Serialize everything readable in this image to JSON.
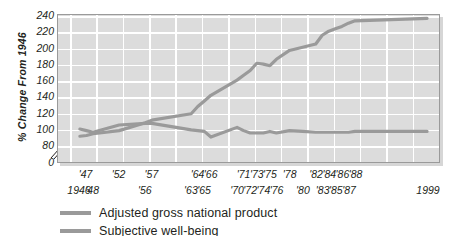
{
  "chart_data": {
    "type": "line",
    "title": "",
    "xlabel": "",
    "ylabel": "% Change From 1946",
    "ylim": [
      80,
      240
    ],
    "y_ticks": [
      "0",
      "80",
      "100",
      "120",
      "140",
      "160",
      "180",
      "200",
      "220",
      "240"
    ],
    "y_axis_break": true,
    "grid": true,
    "legend_position": "below",
    "x_tick_labels_top": [
      "'47",
      "'52",
      "'57",
      "'64",
      "'66",
      "'71",
      "'73",
      "'75",
      "'78",
      "'82",
      "'84",
      "'86",
      "'88"
    ],
    "x_tick_labels_bottom": [
      "1946",
      "'48",
      "'56",
      "'63",
      "'65",
      "'70",
      "'72",
      "'74",
      "'76",
      "'80",
      "'83",
      "'85",
      "'87",
      "1999"
    ],
    "x": [
      1946,
      1947,
      1948,
      1952,
      1956,
      1957,
      1963,
      1964,
      1965,
      1966,
      1970,
      1971,
      1972,
      1973,
      1974,
      1975,
      1976,
      1978,
      1980,
      1982,
      1983,
      1984,
      1985,
      1986,
      1987,
      1988,
      1999
    ],
    "series": [
      {
        "name": "Adjusted gross national product",
        "color": "#9a9a9a",
        "values": [
          90,
          91,
          93,
          97,
          107,
          110,
          118,
          127,
          134,
          141,
          160,
          166,
          172,
          181,
          180,
          178,
          186,
          197,
          201,
          205,
          216,
          221,
          224,
          227,
          231,
          234,
          237
        ]
      },
      {
        "name": "Subjective well-being",
        "color": "#9a9a9a",
        "values": [
          99,
          97,
          95,
          104,
          106,
          106,
          98,
          97,
          96,
          89,
          101,
          97,
          94,
          94,
          94,
          96,
          94,
          97,
          96,
          95,
          95,
          95,
          95,
          95,
          95,
          96,
          96
        ]
      }
    ]
  },
  "legend": {
    "items": [
      {
        "label": "Adjusted gross national product"
      },
      {
        "label": "Subjective well-being"
      }
    ]
  }
}
